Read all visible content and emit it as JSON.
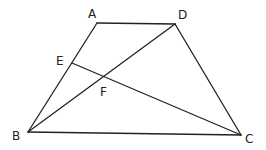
{
  "diagram": {
    "type": "geometry",
    "points": {
      "A": {
        "label": "A",
        "x": 97,
        "y": 23,
        "lx": 88,
        "ly": 18
      },
      "D": {
        "label": "D",
        "x": 175,
        "y": 24,
        "lx": 178,
        "ly": 19
      },
      "B": {
        "label": "B",
        "x": 28,
        "y": 132,
        "lx": 12,
        "ly": 140
      },
      "C": {
        "label": "C",
        "x": 241,
        "y": 135,
        "lx": 245,
        "ly": 143
      },
      "E": {
        "label": "E",
        "x": 72,
        "y": 63,
        "lx": 56,
        "ly": 65
      },
      "F": {
        "label": "F",
        "x": 105,
        "y": 77,
        "lx": 100,
        "ly": 96
      }
    },
    "segments": [
      [
        "A",
        "D"
      ],
      [
        "A",
        "B"
      ],
      [
        "D",
        "C"
      ],
      [
        "B",
        "C"
      ],
      [
        "B",
        "D"
      ],
      [
        "E",
        "C"
      ]
    ]
  }
}
